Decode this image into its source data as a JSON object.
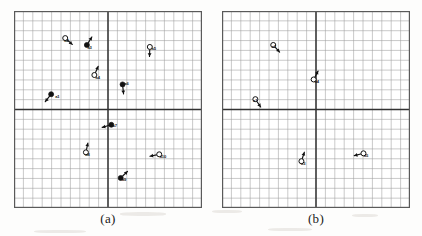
{
  "figure": {
    "background_color": "#fdfdfc",
    "grid_line_color": "#8d8d8d",
    "axis_line_color": "#333333",
    "border_color": "#5a5a5a",
    "marker_fill_color": "#111111",
    "marker_open_color": "#ffffff",
    "arrow_color": "#111111"
  },
  "panels": [
    {
      "id": "panel-a",
      "caption": "(a)",
      "frame": {
        "x": 14,
        "y": 11,
        "width": 188,
        "height": 197
      },
      "grid": {
        "columns": 20,
        "rows": 20,
        "x_range": [
          -10,
          10
        ],
        "y_range": [
          -10,
          10
        ],
        "center_axis_x": 0,
        "center_axis_y": 0,
        "show_grid": true,
        "show_center_axes": true
      },
      "markers": [
        {
          "id": "a1",
          "label": "a1",
          "style": "filled",
          "x": -6.05,
          "y": 1.55,
          "angle_deg": 232,
          "label_dx": 4.0,
          "label_dy": 3.4
        },
        {
          "id": "a2",
          "label": "a2",
          "style": "open",
          "x": -4.55,
          "y": 7.25,
          "angle_deg": 318,
          "label_dx": -1.0,
          "label_dy": 4.2
        },
        {
          "id": "a3",
          "label": "a3",
          "style": "filled",
          "x": -2.25,
          "y": 6.55,
          "angle_deg": 58,
          "label_dx": 0.6,
          "label_dy": 3.7
        },
        {
          "id": "a4",
          "label": "a4",
          "style": "open",
          "x": -1.45,
          "y": 3.5,
          "angle_deg": 66,
          "label_dx": 1.1,
          "label_dy": 3.6
        },
        {
          "id": "a5",
          "label": "a5",
          "style": "open",
          "x": 4.45,
          "y": 6.35,
          "angle_deg": 268,
          "label_dx": 1.7,
          "label_dy": 2.6
        },
        {
          "id": "a6",
          "label": "a6",
          "style": "filled",
          "x": 1.55,
          "y": 2.55,
          "angle_deg": 276,
          "label_dx": 1.7,
          "label_dy": 1.1
        },
        {
          "id": "a7",
          "label": "a7",
          "style": "filled",
          "x": 0.35,
          "y": -1.55,
          "angle_deg": 196,
          "label_dx": 1.2,
          "label_dy": 2.2
        },
        {
          "id": "a8",
          "label": "a8",
          "style": "open",
          "x": -2.35,
          "y": -4.35,
          "angle_deg": 78,
          "label_dx": -0.6,
          "label_dy": 3.3
        },
        {
          "id": "a9",
          "label": "a9",
          "style": "filled",
          "x": 1.35,
          "y": -6.95,
          "angle_deg": 44,
          "label_dx": 1.2,
          "label_dy": 2.8
        },
        {
          "id": "a10",
          "label": "a10",
          "style": "open",
          "x": 5.45,
          "y": -4.55,
          "angle_deg": 192,
          "label_dx": 0.4,
          "label_dy": 3.2
        }
      ]
    },
    {
      "id": "panel-b",
      "caption": "(b)",
      "frame": {
        "x": 222,
        "y": 11,
        "width": 188,
        "height": 197
      },
      "grid": {
        "columns": 20,
        "rows": 20,
        "x_range": [
          -10,
          10
        ],
        "y_range": [
          -10,
          10
        ],
        "center_axis_x": 0,
        "center_axis_y": 0,
        "show_grid": true,
        "show_center_axes": true
      },
      "markers": [
        {
          "id": "b1",
          "label": "a1",
          "style": "open",
          "x": -6.45,
          "y": 1.05,
          "angle_deg": 304,
          "label_dx": -2.4,
          "label_dy": 2.6
        },
        {
          "id": "b2",
          "label": "a2",
          "style": "open",
          "x": -4.55,
          "y": 6.55,
          "angle_deg": 312,
          "label_dx": -1.6,
          "label_dy": 3.5
        },
        {
          "id": "b3",
          "label": "a3",
          "style": "open",
          "x": -1.55,
          "y": -5.25,
          "angle_deg": 72,
          "label_dx": -0.4,
          "label_dy": 3.4
        },
        {
          "id": "b4",
          "label": "a4",
          "style": "open",
          "x": -0.25,
          "y": 3.05,
          "angle_deg": 62,
          "label_dx": 1.0,
          "label_dy": 3.4
        },
        {
          "id": "b5",
          "label": "a5",
          "style": "open",
          "x": 5.05,
          "y": -4.45,
          "angle_deg": 194,
          "label_dx": 0.4,
          "label_dy": 3.2
        }
      ]
    }
  ],
  "chart_data": {
    "type": "scatter",
    "xlabel": "",
    "ylabel": "",
    "xlim": [
      -10,
      10
    ],
    "ylim": [
      -10,
      10
    ],
    "grid": true,
    "legend": "none",
    "subplots": [
      {
        "name": "(a)",
        "series": [
          {
            "name": "leaders (filled)",
            "marker": "filled-circle",
            "points": [
              {
                "label": "a1",
                "x": -6.05,
                "y": 1.55,
                "heading_deg": 232
              },
              {
                "label": "a3",
                "x": -2.25,
                "y": 6.55,
                "heading_deg": 58
              },
              {
                "label": "a6",
                "x": 1.55,
                "y": 2.55,
                "heading_deg": 276
              },
              {
                "label": "a7",
                "x": 0.35,
                "y": -1.55,
                "heading_deg": 196
              },
              {
                "label": "a9",
                "x": 1.35,
                "y": -6.95,
                "heading_deg": 44
              }
            ]
          },
          {
            "name": "followers (open)",
            "marker": "open-circle",
            "points": [
              {
                "label": "a2",
                "x": -4.55,
                "y": 7.25,
                "heading_deg": 318
              },
              {
                "label": "a4",
                "x": -1.45,
                "y": 3.5,
                "heading_deg": 66
              },
              {
                "label": "a5",
                "x": 4.45,
                "y": 6.35,
                "heading_deg": 268
              },
              {
                "label": "a8",
                "x": -2.35,
                "y": -4.35,
                "heading_deg": 78
              },
              {
                "label": "a10",
                "x": 5.45,
                "y": -4.55,
                "heading_deg": 192
              }
            ]
          }
        ]
      },
      {
        "name": "(b)",
        "series": [
          {
            "name": "agents (open)",
            "marker": "open-circle",
            "points": [
              {
                "label": "a1",
                "x": -6.45,
                "y": 1.05,
                "heading_deg": 304
              },
              {
                "label": "a2",
                "x": -4.55,
                "y": 6.55,
                "heading_deg": 312
              },
              {
                "label": "a3",
                "x": -1.55,
                "y": -5.25,
                "heading_deg": 72
              },
              {
                "label": "a4",
                "x": -0.25,
                "y": 3.05,
                "heading_deg": 62
              },
              {
                "label": "a5",
                "x": 5.05,
                "y": -4.45,
                "heading_deg": 194
              }
            ]
          }
        ]
      }
    ]
  }
}
